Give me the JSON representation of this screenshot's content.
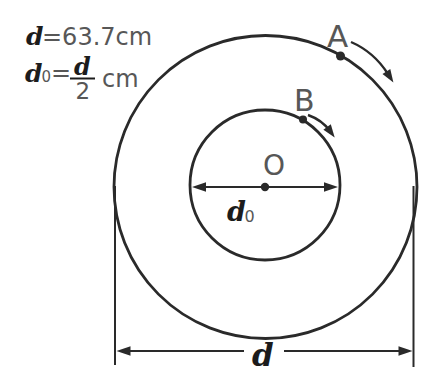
{
  "figure": {
    "background_color": "#ffffff",
    "line_color": "#2a2a2a",
    "gray_text_color": "#575757",
    "dark_text_color": "#1c1c1c",
    "formulas": {
      "line1": {
        "symbol": "d",
        "rest": "=63.7cm"
      },
      "line2": {
        "symbol": "d",
        "subscript": "0",
        "equals": "=",
        "fraction_numerator": "d",
        "fraction_denominator": "2",
        "unit": "cm"
      }
    },
    "labels": {
      "point_a": "A",
      "point_b": "B",
      "center": "O",
      "inner_diameter_symbol": "d",
      "inner_diameter_subscript": "0",
      "outer_diameter": "d"
    }
  }
}
